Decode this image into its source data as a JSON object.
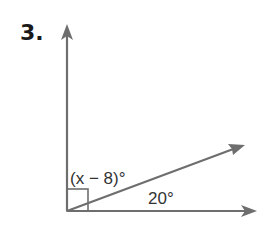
{
  "problem_number": "3.",
  "labels": {
    "upper_angle": "(x − 8)°",
    "lower_angle": "20°"
  },
  "colors": {
    "line": "#6e6e6e",
    "text": "#1a1a1a"
  },
  "diagram": {
    "vertex": [
      67,
      211
    ],
    "rays": [
      "vertical-up",
      "diagonal",
      "horizontal-right"
    ],
    "right_angle_marker": true
  }
}
